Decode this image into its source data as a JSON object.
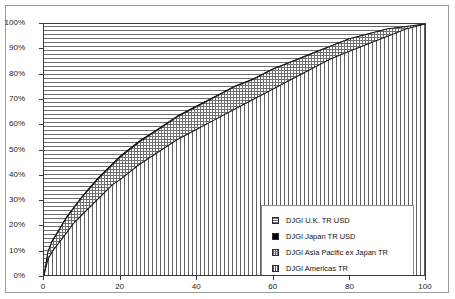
{
  "chart_data": {
    "type": "area",
    "title": "",
    "subtitle": "",
    "xlabel": "",
    "ylabel": "",
    "xlim": [
      0,
      100
    ],
    "ylim": [
      0,
      1.0
    ],
    "grid": false,
    "stacked": true,
    "legend_position": "inside-center-right",
    "x_ticks": [
      "0",
      "20",
      "40",
      "60",
      "80",
      "100"
    ],
    "x_tick_values": [
      0,
      20,
      40,
      60,
      80,
      100
    ],
    "y_ticks": [
      "0%",
      "10%",
      "20%",
      "30%",
      "40%",
      "50%",
      "60%",
      "70%",
      "80%",
      "90%",
      "100%"
    ],
    "y_tick_values": [
      0,
      10,
      20,
      30,
      40,
      50,
      60,
      70,
      80,
      90,
      100
    ],
    "x": [
      0,
      1,
      2,
      4,
      6,
      8,
      10,
      14,
      18,
      20,
      25,
      30,
      35,
      40,
      45,
      50,
      55,
      60,
      65,
      70,
      75,
      80,
      85,
      90,
      95,
      100
    ],
    "series": [
      {
        "name": "DJGI Americas TR",
        "pattern": "vertical-lines",
        "cumulative_values": [
          0,
          6,
          9,
          13,
          17,
          21,
          24,
          30,
          36,
          38,
          44,
          49,
          54,
          58,
          62,
          66,
          70,
          74,
          78,
          82,
          86,
          89,
          92,
          95,
          98,
          100
        ]
      },
      {
        "name": "DJGI Asia Pacific ex Japan TR",
        "pattern": "crosshatch-gray",
        "cumulative_values": [
          0,
          9,
          13,
          18,
          23,
          27,
          31,
          38,
          44,
          47,
          53,
          58,
          63,
          67,
          71,
          75,
          78,
          82,
          85,
          88,
          91,
          94,
          96,
          98,
          99,
          100
        ]
      },
      {
        "name": "DJGI Japan TR USD",
        "pattern": "solid-black",
        "cumulative_values": [
          0,
          9.5,
          13.6,
          18.6,
          23.6,
          27.6,
          31.6,
          38.6,
          44.6,
          47.6,
          53.6,
          58.5,
          63.5,
          67.5,
          71.4,
          75.4,
          78.4,
          82.3,
          85.3,
          88.3,
          91.2,
          94.2,
          96.2,
          98.1,
          99.1,
          100
        ]
      },
      {
        "name": "DJGI U.K. TR USD",
        "pattern": "horizontal-lines",
        "cumulative_values": [
          100,
          100,
          100,
          100,
          100,
          100,
          100,
          100,
          100,
          100,
          100,
          100,
          100,
          100,
          100,
          100,
          100,
          100,
          100,
          100,
          100,
          100,
          100,
          100,
          100,
          100
        ]
      }
    ],
    "legend": [
      {
        "label": "DJGI U.K. TR USD",
        "pattern": "horizontal-lines"
      },
      {
        "label": "DJGI Japan TR USD",
        "pattern": "solid-black"
      },
      {
        "label": "DJGI Asia Pacific ex Japan TR",
        "pattern": "crosshatch-gray"
      },
      {
        "label": "DJGI Americas TR",
        "pattern": "vertical-lines"
      }
    ],
    "colors": {
      "axis": "#3a3a3a",
      "frame": "#9a9a9a",
      "hatch": "#6f6f6f",
      "japan": "#000000",
      "text": "#1a1a1a"
    }
  }
}
